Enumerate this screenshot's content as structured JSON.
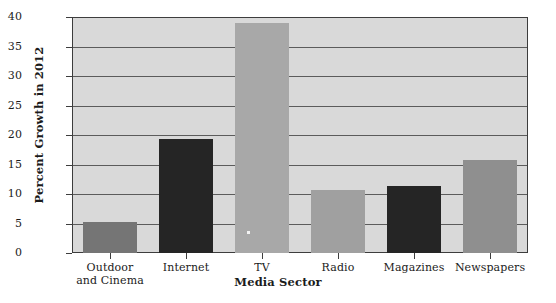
{
  "chart_data": {
    "type": "bar",
    "title": "",
    "xlabel": "Media Sector",
    "ylabel": "Percent Growth in 2012",
    "categories": [
      "Outdoor and Cinema",
      "Internet",
      "TV",
      "Radio",
      "Magazines",
      "Newspapers"
    ],
    "category_lines": [
      [
        "Outdoor",
        "and Cinema"
      ],
      [
        "Internet"
      ],
      [
        "TV"
      ],
      [
        "Radio"
      ],
      [
        "Magazines"
      ],
      [
        "Newspapers"
      ]
    ],
    "values": [
      5.2,
      19.3,
      39.0,
      10.6,
      11.3,
      15.8
    ],
    "bar_colors": [
      "#757575",
      "#252525",
      "#a8a8a8",
      "#a0a0a0",
      "#252525",
      "#8f8f8f"
    ],
    "ylim": [
      0,
      40
    ],
    "yticks": [
      0,
      5,
      10,
      15,
      20,
      25,
      30,
      35,
      40
    ],
    "ytick_labels": [
      "0",
      "5",
      "10",
      "15",
      "20",
      "25",
      "30",
      "35",
      "40"
    ],
    "grid": true,
    "legend": "none",
    "plot_background": "#d9d9d9",
    "axis_color": "#3d3d3d",
    "gridline_color": "#5c5c5c",
    "page_background": "#ffffff"
  }
}
